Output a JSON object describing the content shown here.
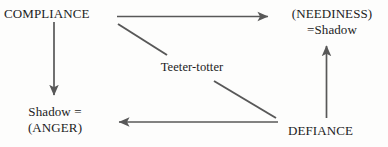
{
  "diagram": {
    "title": "Teeter-totter",
    "background_color": "#fdfdfc",
    "stroke_color": "#585858",
    "text_color": "#1c1c1c",
    "nodes": [
      {
        "id": "compliance",
        "text": "COMPLIANCE",
        "lines": [
          "COMPLIANCE"
        ]
      },
      {
        "id": "neediness",
        "text": "(NEEDINESS) =Shadow",
        "lines": [
          "(NEEDINESS)",
          "=Shadow"
        ]
      },
      {
        "id": "shadow_anger",
        "text": "Shadow = (ANGER)",
        "lines": [
          "Shadow =",
          "(ANGER)"
        ]
      },
      {
        "id": "defiance",
        "text": "DEFIANCE",
        "lines": [
          "DEFIANCE"
        ]
      },
      {
        "id": "teeter",
        "text": "Teeter-totter",
        "lines": [
          "Teeter-totter"
        ]
      }
    ],
    "edges": [
      {
        "id": "compliance-to-neediness",
        "from": "COMPLIANCE",
        "to": "(NEEDINESS)=Shadow",
        "style": "arrow",
        "direction": "right"
      },
      {
        "id": "compliance-to-shadow-anger",
        "from": "COMPLIANCE",
        "to": "Shadow = (ANGER)",
        "style": "arrow",
        "direction": "down"
      },
      {
        "id": "defiance-to-shadow-anger",
        "from": "DEFIANCE",
        "to": "Shadow = (ANGER)",
        "style": "arrow",
        "direction": "left"
      },
      {
        "id": "defiance-to-neediness",
        "from": "DEFIANCE",
        "to": "(NEEDINESS)=Shadow",
        "style": "arrow",
        "direction": "up"
      },
      {
        "id": "teeter-diagonal-upper",
        "from": "COMPLIANCE",
        "to": "Teeter-totter",
        "style": "line",
        "direction": "none"
      },
      {
        "id": "teeter-diagonal-lower",
        "from": "Teeter-totter",
        "to": "DEFIANCE",
        "style": "line",
        "direction": "none"
      }
    ]
  }
}
